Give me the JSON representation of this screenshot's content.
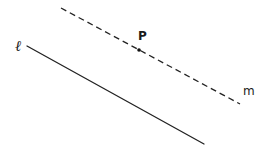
{
  "diagram": {
    "type": "parallel-lines",
    "lines": [
      {
        "id": "l",
        "label": "ℓ",
        "style": "solid",
        "color": "#222222",
        "from": [
          27,
          46
        ],
        "to": [
          204,
          144
        ],
        "label_pos": [
          15,
          51
        ]
      },
      {
        "id": "m",
        "label": "m",
        "style": "dashed",
        "color": "#222222",
        "from": [
          61,
          8
        ],
        "to": [
          240,
          104
        ],
        "label_pos": [
          243,
          95
        ]
      }
    ],
    "points": [
      {
        "id": "P",
        "label": "P",
        "on_line": "m",
        "pos": [
          139,
          50
        ],
        "label_pos": [
          138,
          40
        ]
      }
    ]
  }
}
